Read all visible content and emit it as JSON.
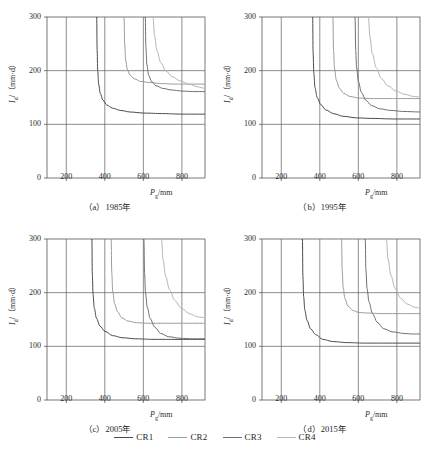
{
  "figure": {
    "panels": [
      {
        "id": "a",
        "caption": "（a）1985年",
        "year": "1985"
      },
      {
        "id": "b",
        "caption": "（b）1995年",
        "year": "1995"
      },
      {
        "id": "c",
        "caption": "（c）2005年",
        "year": "2005"
      },
      {
        "id": "d",
        "caption": "（d）2015年",
        "year": "2015"
      }
    ],
    "legend": {
      "items": [
        {
          "label": "CR1",
          "color": "#4a4a52"
        },
        {
          "label": "CR2",
          "color": "#9b9ba3"
        },
        {
          "label": "CR3",
          "color": "#6e6e78"
        },
        {
          "label": "CR4",
          "color": "#b4b4bc"
        }
      ]
    }
  },
  "chart_data": {
    "type": "line",
    "title": "",
    "panel_count": 4,
    "shared_axes": {
      "xlabel": "Pg/mm",
      "xlabel_base": "P",
      "xlabel_sub": "g",
      "xlabel_unit": "/mm",
      "ylabel": "Id/(mm·d)",
      "ylabel_base": "I",
      "ylabel_sub": "d",
      "ylabel_unit": "/（mm·d）",
      "xlim": [
        100,
        920
      ],
      "ylim": [
        0,
        300
      ],
      "xticks": [
        200,
        400,
        600,
        800
      ],
      "yticks": [
        0,
        100,
        200,
        300
      ],
      "grid": true
    },
    "series_names": [
      "CR1",
      "CR2",
      "CR3",
      "CR4"
    ],
    "panels": [
      {
        "id": "a",
        "label": "（a）1985年",
        "series": [
          {
            "name": "CR1",
            "color": "#4a4a52",
            "asymptote_x": 355,
            "asymptote_y": 119,
            "points": [
              [
                358,
                300
              ],
              [
                360,
                240
              ],
              [
                363,
                200
              ],
              [
                368,
                175
              ],
              [
                376,
                158
              ],
              [
                390,
                145
              ],
              [
                410,
                136
              ],
              [
                440,
                130
              ],
              [
                480,
                126
              ],
              [
                530,
                123
              ],
              [
                600,
                121
              ],
              [
                700,
                120
              ],
              [
                800,
                119
              ],
              [
                920,
                119
              ]
            ]
          },
          {
            "name": "CR2",
            "color": "#9b9ba3",
            "asymptote_x": 497,
            "asymptote_y": 175,
            "points": [
              [
                500,
                300
              ],
              [
                503,
                250
              ],
              [
                508,
                220
              ],
              [
                516,
                203
              ],
              [
                530,
                192
              ],
              [
                552,
                185
              ],
              [
                585,
                180
              ],
              [
                630,
                178
              ],
              [
                690,
                176
              ],
              [
                760,
                175
              ],
              [
                840,
                175
              ],
              [
                920,
                175
              ]
            ]
          },
          {
            "name": "CR3",
            "color": "#6e6e78",
            "asymptote_x": 607,
            "asymptote_y": 161,
            "points": [
              [
                610,
                300
              ],
              [
                613,
                245
              ],
              [
                618,
                212
              ],
              [
                627,
                192
              ],
              [
                642,
                180
              ],
              [
                665,
                172
              ],
              [
                700,
                167
              ],
              [
                745,
                164
              ],
              [
                800,
                162
              ],
              [
                860,
                161
              ],
              [
                920,
                161
              ]
            ]
          },
          {
            "name": "CR4",
            "color": "#b4b4bc",
            "asymptote_x": 645,
            "asymptote_y": 163,
            "points": [
              [
                650,
                300
              ],
              [
                658,
                265
              ],
              [
                670,
                238
              ],
              [
                690,
                215
              ],
              [
                715,
                200
              ],
              [
                748,
                189
              ],
              [
                790,
                181
              ],
              [
                835,
                175
              ],
              [
                880,
                170
              ],
              [
                920,
                167
              ]
            ]
          }
        ]
      },
      {
        "id": "b",
        "label": "（b）1995年",
        "series": [
          {
            "name": "CR1",
            "color": "#4a4a52",
            "asymptote_x": 360,
            "asymptote_y": 110,
            "points": [
              [
                363,
                300
              ],
              [
                365,
                235
              ],
              [
                369,
                195
              ],
              [
                375,
                168
              ],
              [
                386,
                150
              ],
              [
                404,
                137
              ],
              [
                430,
                127
              ],
              [
                470,
                120
              ],
              [
                520,
                115
              ],
              [
                590,
                112
              ],
              [
                670,
                111
              ],
              [
                780,
                110
              ],
              [
                920,
                110
              ]
            ]
          },
          {
            "name": "CR2",
            "color": "#9b9ba3",
            "asymptote_x": 465,
            "asymptote_y": 148,
            "points": [
              [
                468,
                300
              ],
              [
                471,
                240
              ],
              [
                476,
                205
              ],
              [
                485,
                183
              ],
              [
                500,
                168
              ],
              [
                523,
                158
              ],
              [
                555,
                152
              ],
              [
                600,
                149
              ],
              [
                660,
                148
              ],
              [
                740,
                148
              ],
              [
                830,
                148
              ],
              [
                920,
                148
              ]
            ]
          },
          {
            "name": "CR3",
            "color": "#6e6e78",
            "asymptote_x": 580,
            "asymptote_y": 123,
            "points": [
              [
                583,
                300
              ],
              [
                586,
                240
              ],
              [
                591,
                205
              ],
              [
                600,
                180
              ],
              [
                615,
                160
              ],
              [
                638,
                145
              ],
              [
                668,
                135
              ],
              [
                710,
                129
              ],
              [
                765,
                126
              ],
              [
                830,
                124
              ],
              [
                920,
                123
              ]
            ]
          },
          {
            "name": "CR4",
            "color": "#b4b4bc",
            "asymptote_x": 648,
            "asymptote_y": 150,
            "points": [
              [
                652,
                300
              ],
              [
                660,
                263
              ],
              [
                672,
                232
              ],
              [
                692,
                206
              ],
              [
                718,
                186
              ],
              [
                752,
                172
              ],
              [
                795,
                162
              ],
              [
                840,
                156
              ],
              [
                885,
                152
              ],
              [
                920,
                151
              ]
            ]
          }
        ]
      },
      {
        "id": "c",
        "label": "（c）2005年",
        "series": [
          {
            "name": "CR1",
            "color": "#4a4a52",
            "asymptote_x": 330,
            "asymptote_y": 113,
            "points": [
              [
                333,
                300
              ],
              [
                335,
                235
              ],
              [
                339,
                197
              ],
              [
                345,
                172
              ],
              [
                356,
                153
              ],
              [
                374,
                138
              ],
              [
                400,
                128
              ],
              [
                440,
                120
              ],
              [
                490,
                116
              ],
              [
                560,
                114
              ],
              [
                650,
                113
              ],
              [
                760,
                113
              ],
              [
                920,
                113
              ]
            ]
          },
          {
            "name": "CR2",
            "color": "#9b9ba3",
            "asymptote_x": 430,
            "asymptote_y": 143,
            "points": [
              [
                433,
                300
              ],
              [
                436,
                238
              ],
              [
                441,
                203
              ],
              [
                450,
                180
              ],
              [
                465,
                165
              ],
              [
                488,
                153
              ],
              [
                520,
                147
              ],
              [
                565,
                144
              ],
              [
                625,
                143
              ],
              [
                710,
                143
              ],
              [
                810,
                143
              ],
              [
                920,
                143
              ]
            ]
          },
          {
            "name": "CR3",
            "color": "#6e6e78",
            "asymptote_x": 600,
            "asymptote_y": 114,
            "points": [
              [
                603,
                300
              ],
              [
                606,
                238
              ],
              [
                611,
                200
              ],
              [
                620,
                173
              ],
              [
                635,
                152
              ],
              [
                658,
                136
              ],
              [
                690,
                124
              ],
              [
                730,
                118
              ],
              [
                790,
                115
              ],
              [
                855,
                114
              ],
              [
                920,
                114
              ]
            ]
          },
          {
            "name": "CR4",
            "color": "#b4b4bc",
            "asymptote_x": 690,
            "asymptote_y": 152,
            "points": [
              [
                694,
                300
              ],
              [
                702,
                262
              ],
              [
                715,
                231
              ],
              [
                735,
                206
              ],
              [
                762,
                186
              ],
              [
                796,
                171
              ],
              [
                838,
                161
              ],
              [
                880,
                155
              ],
              [
                920,
                153
              ]
            ]
          }
        ]
      },
      {
        "id": "d",
        "label": "（d）2015年",
        "series": [
          {
            "name": "CR1",
            "color": "#4a4a52",
            "asymptote_x": 307,
            "asymptote_y": 106,
            "points": [
              [
                310,
                300
              ],
              [
                312,
                232
              ],
              [
                316,
                193
              ],
              [
                322,
                168
              ],
              [
                333,
                149
              ],
              [
                351,
                133
              ],
              [
                378,
                122
              ],
              [
                415,
                113
              ],
              [
                465,
                109
              ],
              [
                535,
                107
              ],
              [
                630,
                106
              ],
              [
                750,
                106
              ],
              [
                920,
                106
              ]
            ]
          },
          {
            "name": "CR2",
            "color": "#9b9ba3",
            "asymptote_x": 510,
            "asymptote_y": 161,
            "points": [
              [
                513,
                300
              ],
              [
                516,
                243
              ],
              [
                521,
                210
              ],
              [
                530,
                189
              ],
              [
                546,
                175
              ],
              [
                570,
                167
              ],
              [
                603,
                163
              ],
              [
                650,
                162
              ],
              [
                715,
                161
              ],
              [
                800,
                161
              ],
              [
                920,
                161
              ]
            ]
          },
          {
            "name": "CR3",
            "color": "#6e6e78",
            "asymptote_x": 632,
            "asymptote_y": 123,
            "points": [
              [
                636,
                300
              ],
              [
                639,
                243
              ],
              [
                645,
                208
              ],
              [
                655,
                183
              ],
              [
                672,
                162
              ],
              [
                697,
                145
              ],
              [
                730,
                133
              ],
              [
                775,
                127
              ],
              [
                835,
                124
              ],
              [
                880,
                123
              ],
              [
                920,
                123
              ]
            ]
          },
          {
            "name": "CR4",
            "color": "#b4b4bc",
            "asymptote_x": 740,
            "asymptote_y": 170,
            "points": [
              [
                745,
                300
              ],
              [
                754,
                263
              ],
              [
                768,
                233
              ],
              [
                790,
                208
              ],
              [
                818,
                190
              ],
              [
                852,
                179
              ],
              [
                890,
                173
              ],
              [
                920,
                171
              ]
            ]
          }
        ]
      }
    ]
  }
}
